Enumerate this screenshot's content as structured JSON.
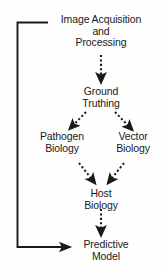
{
  "diagram": {
    "background_color": "#fefefe",
    "stroke_color": "#1a1a1a",
    "text_color": "#1a1a1a",
    "nodes": [
      {
        "id": "image-acquisition",
        "label": "Image Acquisition\nand\nProcessing"
      },
      {
        "id": "ground-truthing",
        "label": "Ground\nTruthing"
      },
      {
        "id": "pathogen-biology",
        "label": "Pathogen\nBiology"
      },
      {
        "id": "vector-biology",
        "label": "Vector\nBiology"
      },
      {
        "id": "host-biology",
        "label": "Host\nBiology"
      },
      {
        "id": "predictive-model",
        "label": "Predictive\nModel"
      }
    ],
    "edges": [
      {
        "id": "edge-acquisition-to-ground",
        "from": "image-acquisition",
        "to": "ground-truthing",
        "style": "dashed"
      },
      {
        "id": "edge-ground-to-pathogen",
        "from": "ground-truthing",
        "to": "pathogen-biology",
        "style": "dashed"
      },
      {
        "id": "edge-ground-to-vector",
        "from": "ground-truthing",
        "to": "vector-biology",
        "style": "dashed"
      },
      {
        "id": "edge-pathogen-to-host",
        "from": "pathogen-biology",
        "to": "host-biology",
        "style": "dashed"
      },
      {
        "id": "edge-vector-to-host",
        "from": "vector-biology",
        "to": "host-biology",
        "style": "dashed"
      },
      {
        "id": "edge-host-to-predictive",
        "from": "host-biology",
        "to": "predictive-model",
        "style": "dashed"
      },
      {
        "id": "edge-feedback-loop",
        "from": "image-acquisition",
        "to": "predictive-model",
        "style": "solid"
      }
    ]
  }
}
